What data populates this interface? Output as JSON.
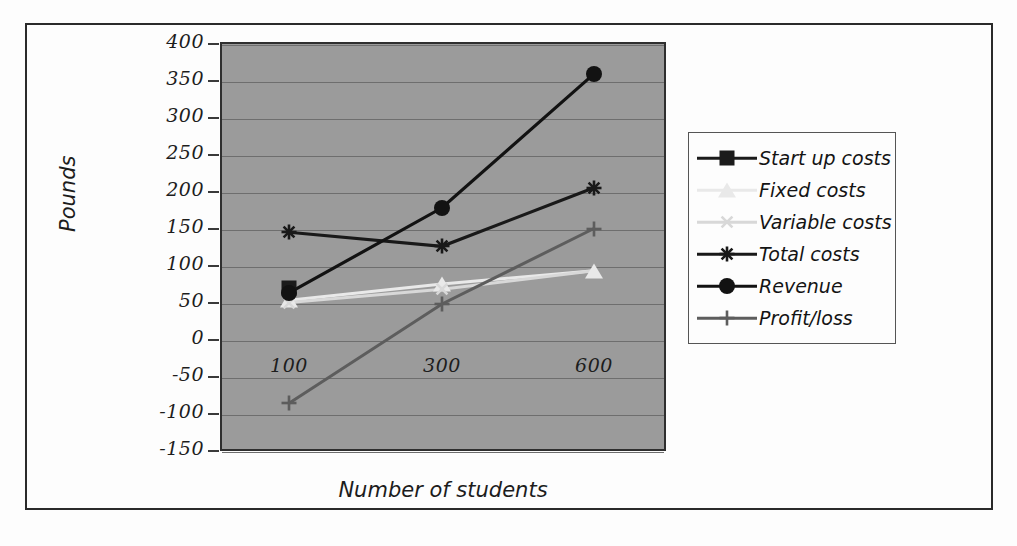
{
  "chart_data": {
    "type": "line",
    "title": "",
    "xlabel": "Number of students",
    "ylabel": "Pounds",
    "categories": [
      "100",
      "300",
      "600"
    ],
    "x": [
      100,
      300,
      600
    ],
    "ylim": [
      -150,
      400
    ],
    "ytick_step": 50,
    "yticks": [
      "400",
      "350",
      "300",
      "250",
      "200",
      "150",
      "100",
      "50",
      "0",
      "-50",
      "-100",
      "-150"
    ],
    "grid": true,
    "legend_position": "right",
    "plot_background": "#9b9b9b",
    "series": [
      {
        "name": "Start up costs",
        "marker": "square",
        "color": "#1b1b1b",
        "values": [
          72,
          null,
          null
        ]
      },
      {
        "name": "Fixed costs",
        "marker": "triangle",
        "color": "#e9e9e9",
        "values": [
          55,
          77,
          95
        ]
      },
      {
        "name": "Variable costs",
        "marker": "x",
        "color": "#d8d8d8",
        "values": [
          52,
          70,
          95
        ]
      },
      {
        "name": "Total costs",
        "marker": "asterisk",
        "color": "#191919",
        "values": [
          147,
          128,
          207
        ]
      },
      {
        "name": "Revenue",
        "marker": "circle",
        "color": "#121212",
        "values": [
          65,
          180,
          361
        ]
      },
      {
        "name": "Profit/loss",
        "marker": "plus",
        "color": "#5d5d5d",
        "values": [
          -84,
          50,
          152
        ]
      }
    ]
  },
  "axes": {
    "y_title": "Pounds",
    "x_title": "Number of students"
  },
  "legend": {
    "items": [
      {
        "label": "Start up costs"
      },
      {
        "label": "Fixed costs"
      },
      {
        "label": "Variable costs"
      },
      {
        "label": "Total costs"
      },
      {
        "label": "Revenue"
      },
      {
        "label": "Profit/loss"
      }
    ]
  }
}
